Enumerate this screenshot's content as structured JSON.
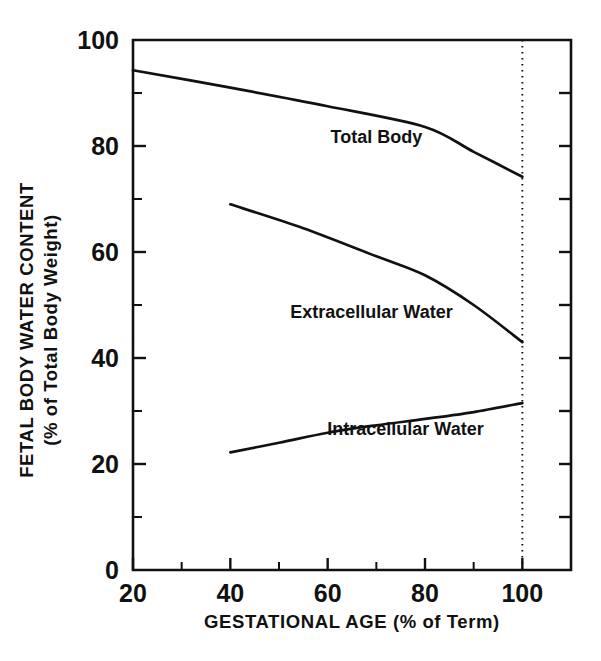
{
  "chart_data": {
    "type": "line",
    "title": "",
    "xlabel": "GESTATIONAL AGE (% of Term)",
    "ylabel_line1": "FETAL BODY WATER CONTENT",
    "ylabel_line2": "(% of Total Body Weight)",
    "xlim": [
      20,
      110
    ],
    "ylim": [
      0,
      100
    ],
    "x_major_ticks": [
      20,
      40,
      60,
      80,
      100
    ],
    "x_major_tick_labels": [
      "20",
      "40",
      "60",
      "80",
      "100"
    ],
    "x_minor_ticks": [
      30,
      50,
      70,
      90
    ],
    "y_major_ticks": [
      0,
      20,
      40,
      60,
      80,
      100
    ],
    "y_major_tick_labels": [
      "0",
      "20",
      "40",
      "60",
      "80",
      "100"
    ],
    "y_minor_ticks": [
      10,
      30,
      50,
      70,
      90
    ],
    "grid": false,
    "legend_position": "inline-annotations",
    "annotations": [
      {
        "text": "Total Body",
        "x": 70,
        "y": 80.5
      },
      {
        "text": "Extracellular Water",
        "x": 69,
        "y": 47.5
      },
      {
        "text": "Intracellular Water",
        "x": 76,
        "y": 25.5
      }
    ],
    "reference_lines": [
      {
        "orientation": "vertical",
        "x": 100,
        "style": "dotted"
      }
    ],
    "series": [
      {
        "name": "Total Body",
        "x": [
          20,
          40,
          60,
          80,
          90,
          100
        ],
        "values": [
          94.3,
          91.0,
          87.5,
          83.6,
          78.9,
          74.2
        ]
      },
      {
        "name": "Extracellular Water",
        "x": [
          40,
          55,
          70,
          80,
          90,
          100
        ],
        "values": [
          69.0,
          64.5,
          59.2,
          55.6,
          50.0,
          43.0
        ]
      },
      {
        "name": "Intracellular Water",
        "x": [
          40,
          50,
          60,
          70,
          80,
          90,
          100
        ],
        "values": [
          22.2,
          24.0,
          25.9,
          27.3,
          28.5,
          29.8,
          31.5
        ]
      }
    ]
  },
  "axes_geometry": {
    "plot_left_px": 133,
    "plot_right_px": 571,
    "plot_top_px": 40,
    "plot_bottom_px": 570
  }
}
